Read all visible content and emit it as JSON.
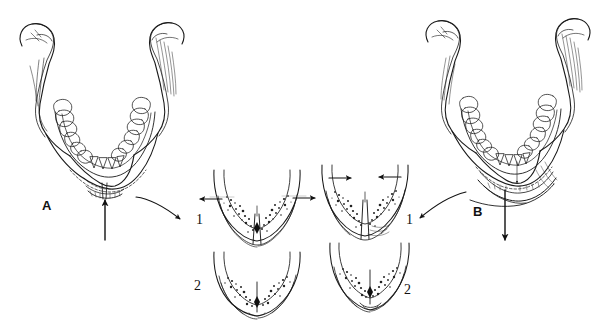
{
  "figure": {
    "kind": "anatomical-line-drawing",
    "background_color": "#ffffff",
    "ink_color": "#1a1a1a",
    "width": 599,
    "height": 321,
    "caption": ""
  },
  "labels": {
    "panel_a": "A",
    "panel_b": "B",
    "inset_a_1": "1",
    "inset_a_2": "2",
    "inset_b_1": "1",
    "inset_b_2": "2"
  },
  "panels": [
    {
      "id": "A",
      "label": "A",
      "description": "Mandible, superior (occlusal) view, left side of figure",
      "force_arrow": {
        "name": "upward-force-arrow",
        "direction": "up",
        "location": "below chin / symphysis"
      },
      "connector_arrow": {
        "name": "curved-connector-arrow",
        "direction": "down-right",
        "points_to": "1"
      }
    },
    {
      "id": "B",
      "label": "B",
      "description": "Mandible, superior (occlusal) view, right side of figure",
      "force_arrow": {
        "name": "downward-force-arrow",
        "direction": "down",
        "location": "below chin / symphysis"
      },
      "connector_arrow": {
        "name": "curved-connector-arrow",
        "direction": "down-left",
        "points_to": "1"
      }
    }
  ],
  "insets": [
    {
      "id": "A1",
      "label": "1",
      "group": "A",
      "description": "Cross-section of mandibular arch with symphyseal gap; arrows directed outward (laterally)",
      "arrow_direction": "outward",
      "gap": true
    },
    {
      "id": "A2",
      "label": "2",
      "group": "A",
      "description": "Cross-section of mandibular arch, reduced / approximated fragments",
      "arrow_direction": "none",
      "gap": false
    },
    {
      "id": "B1",
      "label": "1",
      "group": "B",
      "description": "Cross-section of mandibular arch with symphyseal gap; arrows directed inward (medially)",
      "arrow_direction": "inward",
      "gap": true
    },
    {
      "id": "B2",
      "label": "2",
      "group": "B",
      "description": "Cross-section of mandibular arch, narrowed / collapsed arch",
      "arrow_direction": "none",
      "gap": false
    }
  ]
}
